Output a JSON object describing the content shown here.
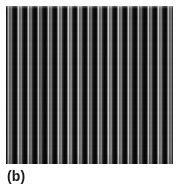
{
  "figure": {
    "caption_label": "(b)",
    "panel_alt": "grayscale-vertical-fringe-pattern",
    "background_color": "#ffffff",
    "caption_color": "#1a1a1a"
  },
  "chart_data": {
    "type": "heatmap",
    "title": "",
    "subtitle": "",
    "xlabel": "",
    "ylabel": "",
    "grid": false,
    "legend_position": "none",
    "annotations": [
      "(b)"
    ],
    "colormap": "grayscale",
    "panel_px": {
      "x": 6,
      "y": 6,
      "width": 167,
      "height": 158
    },
    "stripe_period_px": 10,
    "stripe_count": 17,
    "xlim": [
      0,
      167
    ],
    "ylim": [
      0,
      158
    ],
    "value_range": [
      5,
      200
    ],
    "stripe_profile_levels": [
      10,
      20,
      58,
      110,
      180,
      200,
      160,
      106,
      74,
      126,
      154,
      108,
      60,
      30,
      12,
      5,
      5,
      10
    ],
    "peak_gray_level": 200,
    "trough_gray_level": 5,
    "stripe_peak_x_px": [
      8,
      18,
      28,
      38,
      48,
      58,
      68,
      78,
      88,
      98,
      108,
      118,
      128,
      138,
      148,
      158,
      168
    ],
    "top_band_brighter": true,
    "vertical_noise": true
  }
}
